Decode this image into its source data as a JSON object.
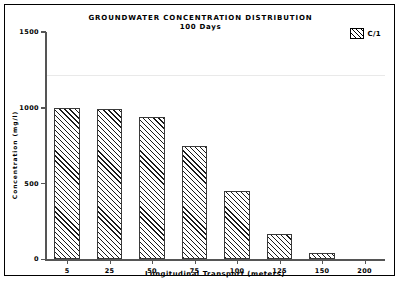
{
  "chart_data": {
    "type": "bar",
    "title": "GROUNDWATER CONCENTRATION DISTRIBUTION",
    "subtitle": "100 Days",
    "xlabel": "Longitudinal Transport (meters)",
    "ylabel": "Concentration (mg/l)",
    "categories": [
      "5",
      "25",
      "50",
      "75",
      "100",
      "125",
      "150",
      "200"
    ],
    "values": [
      1000,
      990,
      940,
      745,
      450,
      165,
      40,
      0
    ],
    "ylim": [
      0,
      1500
    ],
    "y_ticks": [
      "0",
      "500",
      "1000",
      "1500"
    ],
    "y_tick_values": [
      0,
      500,
      1000,
      1500
    ],
    "grid": false,
    "legend": {
      "position": "top-right",
      "entries": [
        {
          "label": "C/1",
          "swatch": "diagonal-hatch"
        }
      ]
    },
    "series": [
      {
        "name": "C/1",
        "values": [
          1000,
          990,
          940,
          745,
          450,
          165,
          40,
          0
        ]
      }
    ]
  }
}
